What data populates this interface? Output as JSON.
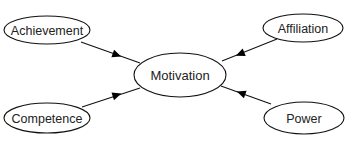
{
  "diagram": {
    "type": "concept-map",
    "center": {
      "id": "motivation",
      "label": "Motivation",
      "cx": 180,
      "cy": 75,
      "rx": 46,
      "ry": 22
    },
    "nodes": [
      {
        "id": "achievement",
        "label": "Achievement",
        "cx": 47,
        "cy": 30,
        "rx": 43,
        "ry": 14
      },
      {
        "id": "affiliation",
        "label": "Affiliation",
        "cx": 303,
        "cy": 28,
        "rx": 40,
        "ry": 14
      },
      {
        "id": "competence",
        "label": "Competence",
        "cx": 47,
        "cy": 118,
        "rx": 43,
        "ry": 15
      },
      {
        "id": "power",
        "label": "Power",
        "cx": 304,
        "cy": 118,
        "rx": 40,
        "ry": 16
      }
    ],
    "edges": [
      {
        "from": "achievement",
        "to": "motivation",
        "x1": 81,
        "y1": 42,
        "x2": 140,
        "y2": 63,
        "arrow_x": 117,
        "arrow_y": 55
      },
      {
        "from": "affiliation",
        "to": "motivation",
        "x1": 277,
        "y1": 39,
        "x2": 222,
        "y2": 61,
        "arrow_x": 240,
        "arrow_y": 54
      },
      {
        "from": "competence",
        "to": "motivation",
        "x1": 82,
        "y1": 107,
        "x2": 140,
        "y2": 88,
        "arrow_x": 117,
        "arrow_y": 95
      },
      {
        "from": "power",
        "to": "motivation",
        "x1": 271,
        "y1": 104,
        "x2": 221,
        "y2": 86,
        "arrow_x": 241,
        "arrow_y": 93
      }
    ],
    "colors": {
      "stroke": "#111111",
      "text": "#222222",
      "background": "#ffffff"
    }
  }
}
